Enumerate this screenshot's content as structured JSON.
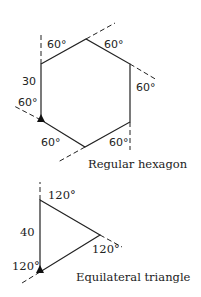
{
  "hexagon": {
    "caption": "Regular hexagon",
    "side_label": "30",
    "angles": [
      "60°",
      "60°",
      "60°",
      "60°",
      "60°",
      "60°"
    ]
  },
  "triangle": {
    "caption": "Equilateral triangle",
    "side_label": "40",
    "angles": [
      "120°",
      "120°",
      "120°"
    ]
  }
}
